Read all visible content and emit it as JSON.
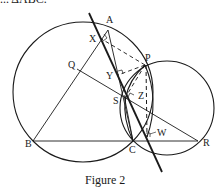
{
  "top_text_fragment": "... ΔABC.",
  "figure": {
    "caption": "Figure 2",
    "colors": {
      "stroke": "#1a1a1a",
      "background": "#ffffff"
    },
    "points": {
      "A": {
        "label": "A",
        "x": 108,
        "y": 30,
        "lx": 106,
        "ly": 23
      },
      "B": {
        "label": "B",
        "x": 33,
        "y": 141,
        "lx": 25,
        "ly": 147
      },
      "C": {
        "label": "C",
        "x": 133,
        "y": 141,
        "lx": 129,
        "ly": 153
      },
      "P": {
        "label": "P",
        "x": 145,
        "y": 65,
        "lx": 145,
        "ly": 61
      },
      "Q": {
        "label": "Q",
        "x": 77,
        "y": 69,
        "lx": 68,
        "ly": 68
      },
      "R": {
        "label": "R",
        "x": 198,
        "y": 141,
        "lx": 203,
        "ly": 146
      },
      "S": {
        "label": "S",
        "x": 124,
        "y": 95,
        "lx": 113,
        "ly": 104
      },
      "X": {
        "label": "X",
        "x": 100,
        "y": 38,
        "lx": 89,
        "ly": 42
      },
      "Y": {
        "label": "Y",
        "x": 118,
        "y": 75,
        "lx": 106,
        "ly": 79
      },
      "Z": {
        "label": "Z",
        "x": 133,
        "y": 96,
        "lx": 138,
        "ly": 99
      },
      "W": {
        "label": "W",
        "x": 147,
        "y": 137,
        "lx": 157,
        "ly": 136
      }
    },
    "circles": [
      {
        "name": "circumcircle-abc",
        "cx": 83,
        "cy": 92,
        "r": 70
      },
      {
        "name": "circle-pcr",
        "cx": 167,
        "cy": 108,
        "r": 47
      }
    ],
    "simson_line": {
      "x1": 89,
      "y1": 13,
      "x2": 162,
      "y2": 172
    }
  }
}
